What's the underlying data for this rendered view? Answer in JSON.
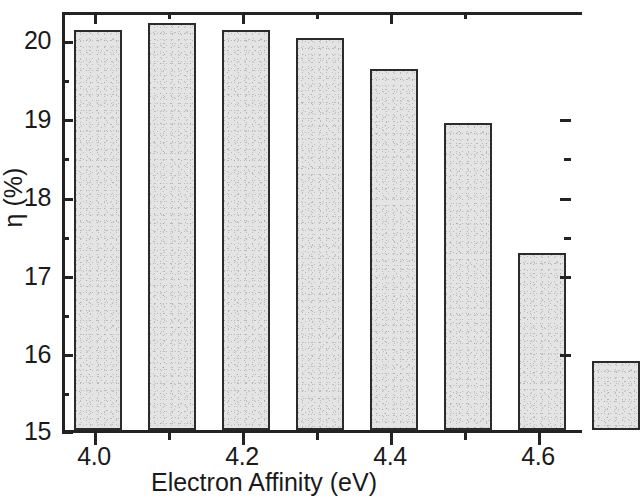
{
  "chart_data": {
    "type": "bar",
    "title": "",
    "subtitle": "",
    "xlabel": "Electron Affinity (eV)",
    "ylabel": "η (%)",
    "categories": [
      "4.0",
      "4.1",
      "4.2",
      "4.3",
      "4.4",
      "4.5",
      "4.6",
      "4.7"
    ],
    "x": [
      4.0,
      4.1,
      4.2,
      4.3,
      4.4,
      4.5,
      4.6,
      4.7
    ],
    "values": [
      20.2,
      20.3,
      20.2,
      20.1,
      19.7,
      19.0,
      17.3,
      15.9
    ],
    "xlim": [
      3.96,
      4.66
    ],
    "ylim": [
      15,
      20.4
    ],
    "x_major_ticks": [
      "4.0",
      "4.2",
      "4.4",
      "4.6"
    ],
    "x_minor_ticks": [
      "4.1",
      "4.3",
      "4.5"
    ],
    "y_major_ticks": [
      "15",
      "16",
      "17",
      "18",
      "19",
      "20"
    ],
    "y_minor_ticks": [
      "15.5",
      "16.5",
      "17.5",
      "18.5",
      "19.5"
    ],
    "grid": false,
    "legend": null,
    "bar_fill_color": "#e2e2e2",
    "bar_edge_color": "#2b2b2b",
    "axis_color": "#232323",
    "background_color": "#ffffff",
    "note": "rightmost bar is clipped by the image crop"
  },
  "axes": {
    "x_title": "Electron Affinity (eV)",
    "y_title": "η (%)"
  },
  "x_tick_labels": [
    {
      "label": "4.0"
    },
    {
      "label": "4.2"
    },
    {
      "label": "4.4"
    },
    {
      "label": "4.6"
    }
  ],
  "y_tick_labels": [
    {
      "label": "20"
    },
    {
      "label": "19"
    },
    {
      "label": "18"
    },
    {
      "label": "17"
    },
    {
      "label": "16"
    },
    {
      "label": "15"
    }
  ]
}
